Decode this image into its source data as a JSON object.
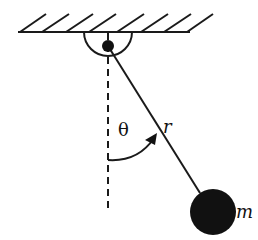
{
  "diagram": {
    "labels": {
      "angle": "θ",
      "length": "r",
      "mass": "m"
    },
    "colors": {
      "stroke": "#1a1a1a",
      "bob": "#111111",
      "background": "#ffffff"
    },
    "geometry": {
      "pivot": [
        108,
        46
      ],
      "bob_center": [
        213,
        212
      ],
      "bob_radius": 23,
      "ceiling_y": 32
    }
  }
}
